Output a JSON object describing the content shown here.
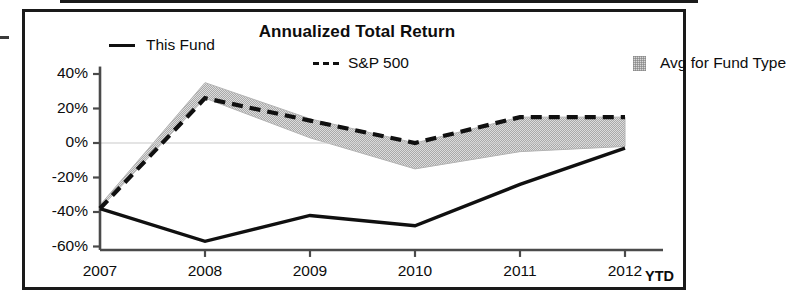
{
  "chart_data": {
    "type": "line",
    "title": "Annualized Total Return",
    "xlabel": "",
    "ylabel": "",
    "x": [
      "2007",
      "2008",
      "2009",
      "2010",
      "2011",
      "2012"
    ],
    "xtick_labels": [
      "2007",
      "2008",
      "2009",
      "2010",
      "2011",
      "2012"
    ],
    "x_axis_suffix": "YTD",
    "ytick_labels": [
      "40%",
      "20%",
      "0%",
      "-20%",
      "-40%",
      "-60%"
    ],
    "ytick_values": [
      40,
      20,
      0,
      -20,
      -40,
      -60
    ],
    "ylim": [
      -62,
      42
    ],
    "grid": false,
    "legend_position": "top",
    "series": [
      {
        "name": "This Fund",
        "style": "solid",
        "color": "#101010",
        "values": [
          -38,
          -57,
          -42,
          -48,
          -24,
          -3
        ]
      },
      {
        "name": "S&P 500",
        "style": "dashed",
        "color": "#101010",
        "values": [
          -38,
          26,
          13,
          0,
          15,
          15
        ]
      },
      {
        "name": "Avg for Fund Type",
        "style": "band",
        "color": "#d7d7d7",
        "band_upper": [
          -36,
          35,
          14,
          0,
          15,
          15
        ],
        "band_lower": [
          -38,
          26,
          3,
          -15,
          -5,
          -2
        ]
      }
    ],
    "legend": [
      {
        "label": "This Fund",
        "marker": "solid-line"
      },
      {
        "label": "S&P 500",
        "marker": "dashed-line"
      },
      {
        "label": "Avg for Fund Type",
        "marker": "shaded-box"
      }
    ]
  }
}
